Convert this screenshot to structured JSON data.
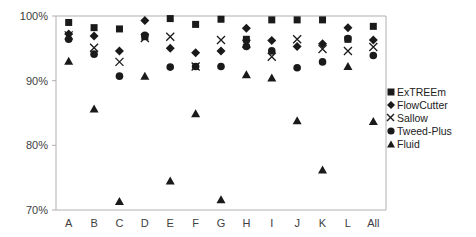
{
  "chart_data": {
    "type": "scatter",
    "title": "",
    "xlabel": "",
    "ylabel": "",
    "categories": [
      "A",
      "B",
      "C",
      "D",
      "E",
      "F",
      "G",
      "H",
      "I",
      "J",
      "K",
      "L",
      "All"
    ],
    "y_ticks": [
      "70%",
      "80%",
      "90%",
      "100%"
    ],
    "ylim": [
      70,
      100
    ],
    "grid": false,
    "legend_position": "right",
    "series": [
      {
        "name": "ExTREEm",
        "marker": "square",
        "values": [
          99.0,
          98.2,
          98.0,
          96.8,
          99.6,
          98.7,
          99.5,
          96.4,
          99.4,
          99.4,
          99.4,
          96.4,
          98.4
        ]
      },
      {
        "name": "FlowCutter",
        "marker": "diamond",
        "values": [
          97.2,
          96.9,
          94.6,
          99.3,
          95.0,
          94.3,
          94.6,
          98.1,
          96.2,
          95.3,
          95.7,
          98.2,
          96.3
        ]
      },
      {
        "name": "Sallow",
        "marker": "x",
        "values": [
          97.0,
          95.1,
          92.9,
          96.6,
          96.8,
          92.2,
          96.3,
          95.7,
          93.7,
          96.4,
          94.9,
          94.6,
          95.2
        ]
      },
      {
        "name": "Tweed-Plus",
        "marker": "circle",
        "values": [
          96.4,
          94.1,
          90.7,
          97.0,
          92.1,
          92.2,
          92.2,
          95.3,
          94.6,
          92.0,
          92.9,
          96.5,
          93.9
        ]
      },
      {
        "name": "Fluid",
        "marker": "triangle",
        "values": [
          93.0,
          85.6,
          71.3,
          90.7,
          74.5,
          84.9,
          71.6,
          90.9,
          90.4,
          83.8,
          76.2,
          92.2,
          83.7
        ]
      }
    ]
  },
  "colors": {
    "marker": "#1a1a1a",
    "axis": "#b0b0b0",
    "text": "#404040"
  },
  "legend": {
    "items": [
      {
        "label": "ExTREEm",
        "icon": "square-icon"
      },
      {
        "label": "FlowCutter",
        "icon": "diamond-icon"
      },
      {
        "label": "Sallow",
        "icon": "x-icon"
      },
      {
        "label": "Tweed-Plus",
        "icon": "circle-icon"
      },
      {
        "label": "Fluid",
        "icon": "triangle-icon"
      }
    ]
  }
}
